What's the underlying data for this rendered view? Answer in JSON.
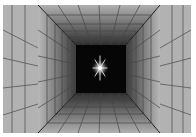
{
  "image": {
    "description": "Grayscale perspective tunnel with grid-lined walls, floor and ceiling converging to a dark center containing a bright star",
    "colors": {
      "background": "#ffffff",
      "wall_light": "#b4b4b4",
      "wall_mid": "#8a8a8a",
      "wall_dark": "#3a3a3a",
      "grid_line": "#444444",
      "center": "#050505",
      "star": "#ffffff"
    },
    "frame": {
      "x1": 3,
      "y1": 5,
      "x2": 191,
      "y2": 133
    },
    "corners_outer": {
      "tl": [
        38,
        5
      ],
      "tr": [
        160,
        5
      ],
      "bl": [
        38,
        133
      ],
      "br": [
        160,
        133
      ]
    },
    "inner_box": {
      "x1": 76,
      "y1": 45,
      "x2": 126,
      "y2": 93
    },
    "star": {
      "cx": 100,
      "cy": 68
    }
  }
}
